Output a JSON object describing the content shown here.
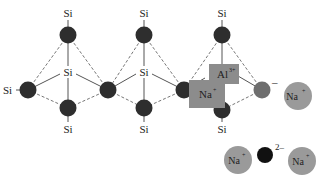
{
  "diagram": {
    "atom_labels": {
      "si": "Si",
      "si_left": "Si",
      "al": "Al",
      "al_charge": "3+",
      "na": "Na",
      "na_charge": "+",
      "neg_charge": "–",
      "oxide_charge": "2–"
    },
    "tetrahedra": [
      {
        "id": "t1",
        "center_label": "Si",
        "top_label": "Si",
        "bottom_label": "Si",
        "left_label": "Si"
      },
      {
        "id": "t2",
        "center_label": "Si",
        "top_label": "Si",
        "bottom_label": "Si"
      },
      {
        "id": "t3",
        "center_label": "Al",
        "center_charge": "3+",
        "top_label": "Si",
        "bottom_label": "Si",
        "bound_cation": "Na+",
        "right_oxygen_charge": "–"
      }
    ],
    "free_ions": [
      {
        "label": "Na",
        "charge": "+"
      },
      {
        "label": "Na",
        "charge": "+"
      },
      {
        "label": "O",
        "charge": "2–"
      },
      {
        "label": "Na",
        "charge": "+"
      }
    ],
    "colors": {
      "oxygen": "#2e2e2e",
      "oxygen_negative": "#6e6e6e",
      "sodium": "#9a9a9a",
      "al_na_box": "#8c8c8c",
      "oxide": "#111111"
    }
  }
}
